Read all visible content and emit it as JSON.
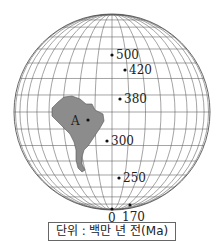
{
  "figure": {
    "type": "apparent polar wander path on globe",
    "continent_label": "A",
    "points": [
      {
        "age": "500",
        "x": 112,
        "y": 55
      },
      {
        "age": "420",
        "x": 125,
        "y": 70
      },
      {
        "age": "380",
        "x": 120,
        "y": 99
      },
      {
        "age": "300",
        "x": 107,
        "y": 141
      },
      {
        "age": "250",
        "x": 119,
        "y": 178
      },
      {
        "age": "170",
        "x": 130,
        "y": 205
      },
      {
        "age": "0",
        "x": 112,
        "y": 209
      }
    ],
    "unit_legend": "단위 : 백만 년 전(Ma)",
    "colors": {
      "continent": "#8c8c8c",
      "grid": "#555555",
      "text": "#222222"
    }
  }
}
